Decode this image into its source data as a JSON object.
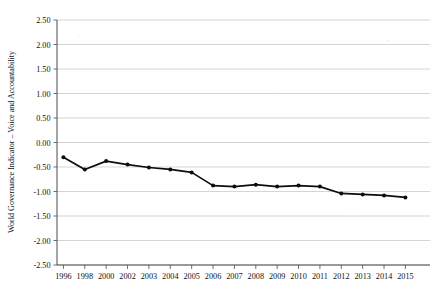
{
  "chart_data": {
    "type": "line",
    "title": "",
    "xlabel": "",
    "ylabel": "World Governance Indicator – Voice and Accountability",
    "categories": [
      "1996",
      "1998",
      "2000",
      "2002",
      "2003",
      "2004",
      "2005",
      "2006",
      "2007",
      "2008",
      "2009",
      "2010",
      "2011",
      "2012",
      "2013",
      "2014",
      "2015"
    ],
    "values": [
      -0.3,
      -0.55,
      -0.38,
      -0.45,
      -0.51,
      -0.55,
      -0.61,
      -0.88,
      -0.9,
      -0.86,
      -0.9,
      -0.88,
      -0.9,
      -1.04,
      -1.06,
      -1.08,
      -1.12
    ],
    "series": [
      {
        "name": "Voice and Accountability",
        "values": [
          -0.3,
          -0.55,
          -0.38,
          -0.45,
          -0.51,
          -0.55,
          -0.61,
          -0.88,
          -0.9,
          -0.86,
          -0.9,
          -0.88,
          -0.9,
          -1.04,
          -1.06,
          -1.08,
          -1.12
        ]
      }
    ],
    "ylim": [
      -2.5,
      2.5
    ],
    "ytick_values": [
      2.5,
      2.0,
      1.5,
      1.0,
      0.5,
      0.0,
      -0.5,
      -1.0,
      -1.5,
      -2.0,
      -2.5
    ],
    "ytick_labels": [
      "2.50",
      "2.00",
      "1.50",
      "1.00",
      "0.50",
      "0.00",
      "-0.50",
      "-1.00",
      "-1.50",
      "-2.00",
      "-2.50"
    ],
    "grid": true,
    "legend": "none",
    "marker": "filled-circle",
    "line_color": "#0d0d0d",
    "grid_color": "#b9b9b9",
    "axis_color": "#4a4a4a"
  }
}
